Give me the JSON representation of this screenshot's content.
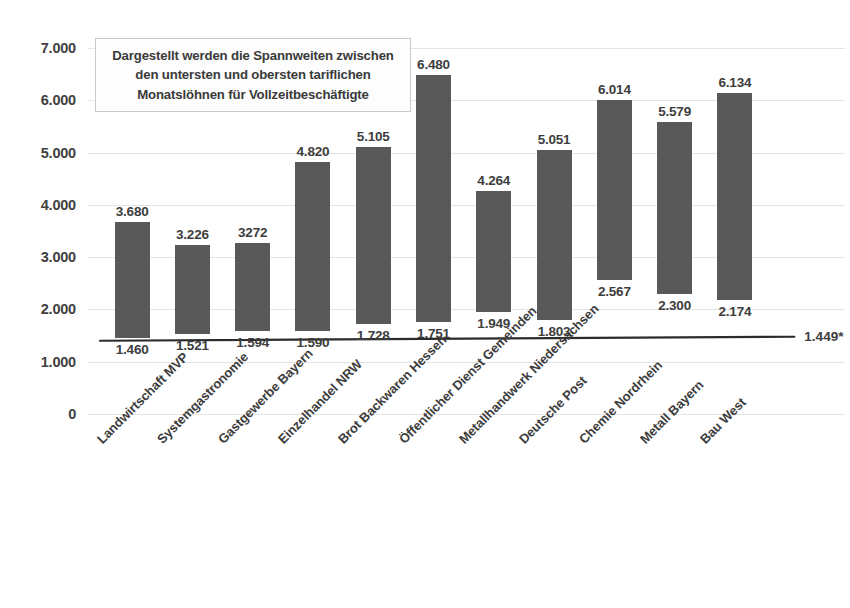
{
  "chart_data": {
    "type": "bar",
    "subtype": "floating-range-bar",
    "title": "",
    "xlabel": "",
    "ylabel": "",
    "ylim": [
      0,
      7000
    ],
    "grid": true,
    "legend": null,
    "categories": [
      "Landwirtschaft MVP",
      "Systemgastronomie",
      "Gastgewerbe Bayern",
      "Einzelhandel NRW",
      "Brot Backwaren Hessen",
      "Öffentlicher Dienst Gemeinden",
      "Metallhandwerk Niedersachsen",
      "Deutsche Post",
      "Chemie Nordrhein",
      "Metall Bayern",
      "Bau West"
    ],
    "series": [
      {
        "name": "oberster tariflicher Monatslohn",
        "values": [
          3680,
          3226,
          3272,
          4820,
          5105,
          6480,
          4264,
          5051,
          6014,
          5579,
          6134
        ],
        "labels": [
          "3.680",
          "3.226",
          "3272",
          "4.820",
          "5.105",
          "6.480",
          "4.264",
          "5.051",
          "6.014",
          "5.579",
          "6.134"
        ]
      },
      {
        "name": "unterster tariflicher Monatslohn",
        "values": [
          1460,
          1521,
          1594,
          1590,
          1728,
          1751,
          1949,
          1803,
          2567,
          2300,
          2174
        ],
        "labels": [
          "1.460",
          "1.521",
          "1.594",
          "1.590",
          "1.728",
          "1.751",
          "1.949",
          "1.803",
          "2.567",
          "2.300",
          "2.174"
        ]
      }
    ],
    "y_ticks": [
      0,
      1000,
      2000,
      3000,
      4000,
      5000,
      6000,
      7000
    ],
    "y_tick_labels": [
      "0",
      "1.000",
      "2.000",
      "3.000",
      "4.000",
      "5.000",
      "6.000",
      "7.000"
    ],
    "reference_line": {
      "name": "gesetzlicher-mindestlohn-referenz",
      "start_value": 1449,
      "end_value": 1449,
      "end_label": "1.449*"
    },
    "annotation": {
      "lines": [
        "Dargestellt werden die Spannweiten zwischen",
        "den untersten und obersten tariflichen",
        "Monatslöhnen für Vollzeitbeschäftigte"
      ]
    },
    "colors": {
      "bar": "#595959",
      "gridline": "#e4e4e4",
      "text": "#3d3d3d",
      "baseline": "#2b2b2b",
      "annotation_border": "#c9c9c9"
    }
  }
}
